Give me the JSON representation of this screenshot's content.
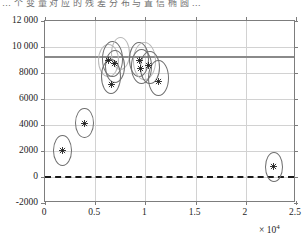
{
  "caption": "… 个 变 量 对 应 的 残 差 分 布 与 置 信 椭 圆 …",
  "chart_data": {
    "type": "scatter",
    "title": "",
    "xlabel": "",
    "ylabel": "",
    "x_exponent_label": "× 10⁴",
    "x_exponent_base": "× 10",
    "x_exponent_power": "4",
    "xlim": [
      0,
      25000
    ],
    "ylim": [
      -2000,
      12000
    ],
    "grid": true,
    "legend": "none",
    "xticks": [
      0,
      5000,
      10000,
      15000,
      20000,
      25000
    ],
    "xticklabels": [
      "0",
      "0.5",
      "1",
      "1.5",
      "2",
      "2.5"
    ],
    "yticks": [
      -2000,
      0,
      2000,
      4000,
      6000,
      8000,
      10000,
      12000
    ],
    "yticklabels": [
      "-2000",
      "0",
      "2000",
      "4000",
      "6000",
      "8000",
      "10 000",
      "12 000"
    ],
    "reference_lines": [
      {
        "name": "upper-limit-line",
        "orientation": "horizontal",
        "y": 9200,
        "style": "solid",
        "color": "#8a8a8a",
        "width": 2
      },
      {
        "name": "zero-line",
        "orientation": "horizontal",
        "y": 0,
        "style": "dashed",
        "color": "#1a1a1a",
        "width": 2
      }
    ],
    "marker": "asterisk",
    "marker_color": "#1a1a1a",
    "points": [
      {
        "id": "p1",
        "x": 1700,
        "y": 2050
      },
      {
        "id": "p2",
        "x": 3900,
        "y": 4150
      },
      {
        "id": "p3",
        "x": 6300,
        "y": 8950
      },
      {
        "id": "p4",
        "x": 6900,
        "y": 8700
      },
      {
        "id": "p5",
        "x": 6600,
        "y": 7100
      },
      {
        "id": "p6",
        "x": 9400,
        "y": 9000
      },
      {
        "id": "p7",
        "x": 9500,
        "y": 8350
      },
      {
        "id": "p8",
        "x": 10300,
        "y": 8550
      },
      {
        "id": "p9",
        "x": 11300,
        "y": 7350
      },
      {
        "id": "p10",
        "x": 22800,
        "y": 800
      }
    ],
    "ellipses": [
      {
        "id": "e1",
        "cx": 1700,
        "cy": 2050,
        "rx": 950,
        "ry": 1180,
        "shade": "dark"
      },
      {
        "id": "e2",
        "cx": 3900,
        "cy": 4150,
        "rx": 950,
        "ry": 1180,
        "shade": "dark"
      },
      {
        "id": "e3",
        "cx": 6300,
        "cy": 8950,
        "rx": 1050,
        "ry": 1280,
        "shade": "light"
      },
      {
        "id": "e4",
        "cx": 6750,
        "cy": 9100,
        "rx": 1050,
        "ry": 1380,
        "shade": "dark"
      },
      {
        "id": "e5",
        "cx": 7550,
        "cy": 9500,
        "rx": 950,
        "ry": 1250,
        "shade": "light"
      },
      {
        "id": "e6",
        "cx": 6600,
        "cy": 7700,
        "rx": 1000,
        "ry": 1350,
        "shade": "dark"
      },
      {
        "id": "e7",
        "cx": 6950,
        "cy": 8500,
        "rx": 1000,
        "ry": 1250,
        "shade": "dark"
      },
      {
        "id": "e8",
        "cx": 9400,
        "cy": 9050,
        "rx": 1000,
        "ry": 1350,
        "shade": "dark"
      },
      {
        "id": "e9",
        "cx": 9900,
        "cy": 8900,
        "rx": 1150,
        "ry": 1450,
        "shade": "light"
      },
      {
        "id": "e10",
        "cx": 9600,
        "cy": 8500,
        "rx": 1050,
        "ry": 1320,
        "shade": "dark"
      },
      {
        "id": "e11",
        "cx": 10500,
        "cy": 8450,
        "rx": 1000,
        "ry": 1280,
        "shade": "dark"
      },
      {
        "id": "e12",
        "cx": 11300,
        "cy": 7600,
        "rx": 1050,
        "ry": 1400,
        "shade": "dark"
      },
      {
        "id": "e13",
        "cx": 22800,
        "cy": 800,
        "rx": 900,
        "ry": 1150,
        "shade": "dark"
      }
    ]
  }
}
